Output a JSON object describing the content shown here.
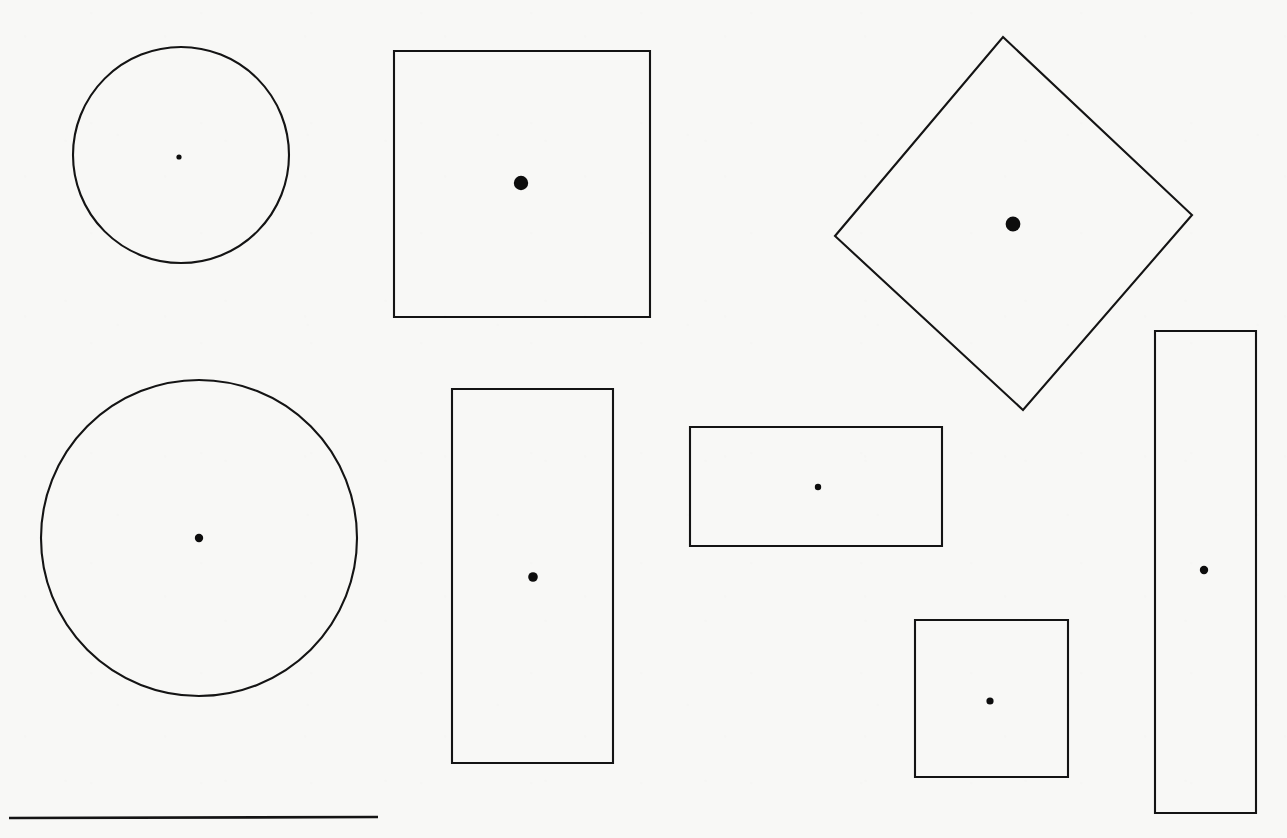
{
  "page": {
    "width": 1287,
    "height": 838,
    "background_color": "#f8f8f6",
    "ink_color": "#141414",
    "dot_color": "#0d0d0d",
    "stroke_width": 2.1
  },
  "chart_data": {
    "type": "scatter",
    "xlabel": "",
    "ylabel": "",
    "xlim": [
      0,
      1287
    ],
    "ylim": [
      838,
      0
    ],
    "grid": false,
    "legend": "none",
    "shapes": [
      {
        "id": "circle-small",
        "label": "Small circle",
        "kind": "circle",
        "cx": 181,
        "cy": 155,
        "r": 108,
        "dot": {
          "cx": 179,
          "cy": 157,
          "r": 2.6
        }
      },
      {
        "id": "square-large",
        "label": "Large square",
        "kind": "rect",
        "x": 394,
        "y": 51,
        "width": 256,
        "height": 266,
        "dot": {
          "cx": 521,
          "cy": 183,
          "r": 7.2
        }
      },
      {
        "id": "diamond",
        "label": "Rotated square (diamond)",
        "kind": "polygon",
        "points": [
          [
            1003,
            37
          ],
          [
            1192,
            215
          ],
          [
            1023,
            410
          ],
          [
            835,
            236
          ]
        ],
        "dot": {
          "cx": 1013,
          "cy": 224,
          "r": 7.4
        }
      },
      {
        "id": "circle-large",
        "label": "Large circle",
        "kind": "circle",
        "cx": 199,
        "cy": 538,
        "r": 158,
        "dot": {
          "cx": 199,
          "cy": 538,
          "r": 4.2
        }
      },
      {
        "id": "rect-tall-left",
        "label": "Tall vertical rectangle (left)",
        "kind": "rect",
        "x": 452,
        "y": 389,
        "width": 161,
        "height": 374,
        "dot": {
          "cx": 533,
          "cy": 577,
          "r": 4.8
        }
      },
      {
        "id": "rect-wide",
        "label": "Wide horizontal rectangle",
        "kind": "rect",
        "x": 690,
        "y": 427,
        "width": 252,
        "height": 119,
        "dot": {
          "cx": 818,
          "cy": 487,
          "r": 3.2
        }
      },
      {
        "id": "square-small",
        "label": "Small square",
        "kind": "rect",
        "x": 915,
        "y": 620,
        "width": 153,
        "height": 157,
        "dot": {
          "cx": 990,
          "cy": 701,
          "r": 3.6
        }
      },
      {
        "id": "rect-tall-right",
        "label": "Tall narrow rectangle (right)",
        "kind": "rect",
        "x": 1155,
        "y": 331,
        "width": 101,
        "height": 482,
        "dot": {
          "cx": 1204,
          "cy": 570,
          "r": 4.2
        }
      }
    ],
    "rules": [
      {
        "id": "baseline-rule",
        "label": "Horizontal rule",
        "x1": 9,
        "y1": 818,
        "x2": 378,
        "y2": 817
      }
    ]
  }
}
